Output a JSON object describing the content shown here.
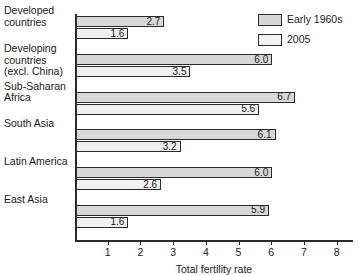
{
  "chart_data": {
    "type": "bar",
    "orientation": "horizontal",
    "title": "",
    "xlabel": "Total fertility rate",
    "ylabel": "",
    "xlim": [
      0,
      8.5
    ],
    "xticks": [
      1,
      2,
      3,
      4,
      5,
      6,
      7,
      8
    ],
    "grid": false,
    "legend_position": "top-right",
    "categories": [
      "Developed countries",
      "Developing countries (excl. China)",
      "Sub-Saharan Africa",
      "South Asia",
      "Latin America",
      "East Asia"
    ],
    "category_lines": [
      [
        "Developed",
        "countries"
      ],
      [
        "Developing",
        "countries",
        "(excl. China)"
      ],
      [
        "Sub-Saharan",
        "Africa"
      ],
      [
        "South Asia"
      ],
      [
        "Latin America"
      ],
      [
        "East Asia"
      ]
    ],
    "series": [
      {
        "name": "Early 1960s",
        "color": "#d8d8d8",
        "values": [
          2.7,
          6.0,
          6.7,
          6.1,
          6.0,
          5.9
        ],
        "labels": [
          "2.7",
          "6.0",
          "6.7",
          "6.1",
          "6.0",
          "5.9"
        ]
      },
      {
        "name": "2005",
        "color": "#f0f0f0",
        "values": [
          1.6,
          3.5,
          5.6,
          3.2,
          2.6,
          1.6
        ],
        "labels": [
          "1.6",
          "3.5",
          "5.6",
          "3.2",
          "2.6",
          "1.6"
        ]
      }
    ]
  },
  "legend": {
    "items": [
      {
        "label": "Early 1960s"
      },
      {
        "label": "2005"
      }
    ]
  },
  "axis": {
    "tick_labels": [
      "1",
      "2",
      "3",
      "4",
      "5",
      "6",
      "7",
      "8"
    ],
    "x_title": "Total fertility rate"
  },
  "colors": {
    "series1": "#d8d8d8",
    "series2": "#f0f0f0",
    "axis": "#2b2b2b",
    "text": "#1a1a1a",
    "background": "#ffffff"
  }
}
